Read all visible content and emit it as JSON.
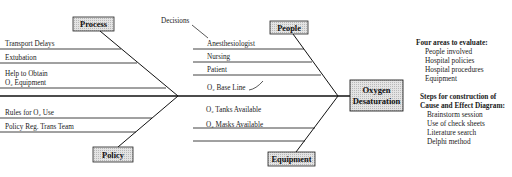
{
  "effect": {
    "line1": "Oxygen",
    "line2": "Desaturation"
  },
  "categories": {
    "process": {
      "label": "Process",
      "causes": [
        "Transport Delays",
        "Extubation",
        "Help to Obtain",
        "O₂ Equipment"
      ]
    },
    "people": {
      "label": "People",
      "annotation": "Decisions",
      "causes": [
        "Anesthesiologist",
        "Nursing",
        "Patient",
        "O₂ Base Line"
      ]
    },
    "policy": {
      "label": "Policy",
      "causes": [
        "Rules for O₂ Use",
        "Policy Reg. Trans Team"
      ]
    },
    "equipment": {
      "label": "Equipment",
      "causes": [
        "O₂ Tanks Available",
        "O₂ Masks Available"
      ]
    }
  },
  "areas_panel": {
    "heading": "Four areas to evaluate:",
    "items": [
      "People involved",
      "Hospital policies",
      "Hospital procedures",
      "Equipment"
    ]
  },
  "steps_panel": {
    "heading_line1": "Steps for construction of",
    "heading_line2": "Cause and Effect Diagram:",
    "items": [
      "Brainstorm session",
      "Use of check sheets",
      "Literature search",
      "Delphi method"
    ]
  }
}
